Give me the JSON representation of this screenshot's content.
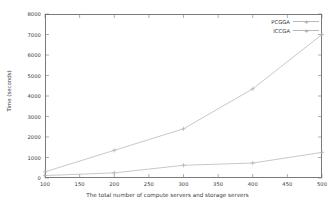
{
  "chart_data": {
    "type": "line",
    "title": "",
    "xlabel": "The total number of compute servers and storage servers",
    "ylabel": "Time (seconds)",
    "xlim": [
      100,
      500
    ],
    "ylim": [
      0,
      8000
    ],
    "xticks": [
      100,
      150,
      200,
      250,
      300,
      350,
      400,
      450,
      500
    ],
    "xtick_labels": [
      "100",
      "150",
      "200",
      "250",
      "300",
      "350",
      "400",
      "450",
      "500"
    ],
    "yticks": [
      0,
      1000,
      2000,
      3000,
      4000,
      5000,
      6000,
      7000,
      8000
    ],
    "ytick_labels": [
      "0",
      "1000",
      "2000",
      "3000",
      "4000",
      "5000",
      "6000",
      "7000",
      "8000"
    ],
    "grid": false,
    "legend_position": "top-right",
    "x": [
      100,
      200,
      300,
      400,
      500
    ],
    "series": [
      {
        "name": "PCGGA",
        "marker": "plus",
        "color": "#b0b0b0",
        "values": [
          300,
          1350,
          2400,
          4350,
          7000
        ]
      },
      {
        "name": "ICCGA",
        "marker": "plus",
        "color": "#b0b0b0",
        "values": [
          120,
          250,
          620,
          730,
          1250
        ]
      }
    ]
  },
  "legend": {
    "entries": [
      {
        "label": "PCGGA"
      },
      {
        "label": "ICCGA"
      }
    ]
  },
  "axes": {
    "y_axis_title": "Time (seconds)",
    "x_axis_title": "The total number of compute servers and storage servers"
  },
  "colors": {
    "axis": "#7a7a7a",
    "text": "#3a3a3a",
    "line": "#b0b0b0",
    "background": "#ffffff"
  }
}
